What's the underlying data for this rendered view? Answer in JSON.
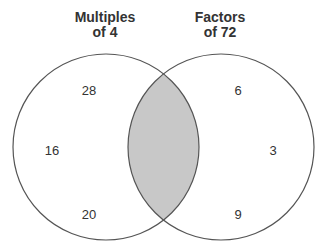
{
  "diagram": {
    "type": "venn",
    "sets": [
      {
        "title_line1": "Multiples",
        "title_line2": "of 4",
        "elements": [
          "28",
          "16",
          "20"
        ]
      },
      {
        "title_line1": "Factors",
        "title_line2": "of 72",
        "elements": [
          "6",
          "3",
          "9"
        ]
      }
    ],
    "intersection": {
      "shaded": true,
      "elements": []
    },
    "colors": {
      "stroke": "#555555",
      "shade": "#c8c8c8",
      "text": "#333333"
    }
  }
}
